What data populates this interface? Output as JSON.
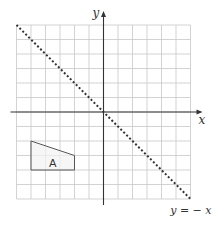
{
  "diagram": {
    "type": "coordinate-grid",
    "grid": {
      "x_min": -6,
      "x_max": 6,
      "y_min": -6,
      "y_max": 6,
      "origin_px": [
        103.5,
        112
      ],
      "unit_px": 14.5,
      "grid_color": "#c8c8c8",
      "axis_color": "#333333"
    },
    "axes": {
      "x_label": "x",
      "y_label": "y"
    },
    "line": {
      "equation_label": "y = − x",
      "from": [
        -6,
        6
      ],
      "to": [
        6,
        -6
      ],
      "style": "dotted",
      "color": "#333333"
    },
    "shape": {
      "label": "A",
      "vertices": [
        [
          -5,
          -2
        ],
        [
          -2,
          -3
        ],
        [
          -2,
          -4
        ],
        [
          -5,
          -4
        ]
      ],
      "fill": "#f2f2f2",
      "stroke": "#555555"
    }
  }
}
